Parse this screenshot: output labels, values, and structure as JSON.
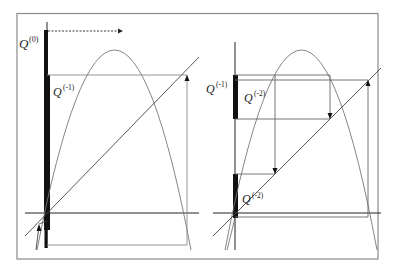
{
  "figure": {
    "frame_color": "#8a8a8a",
    "line_color": "#555555",
    "axis_color": "#222222",
    "bar_color": "#111111"
  },
  "left_panel": {
    "labels": {
      "q0_base": "Q",
      "q0_sup": "(0)",
      "q1_base": "Q",
      "q1_sup": "(-1)"
    },
    "arrow": "dotted-right-arrow"
  },
  "right_panel": {
    "labels": {
      "q1_base": "Q",
      "q1_sup": "(-1)",
      "q2_base": "Q",
      "q2_sup": "(-2)",
      "q2b_base": "Q",
      "q2b_sup": "(-2)"
    }
  }
}
